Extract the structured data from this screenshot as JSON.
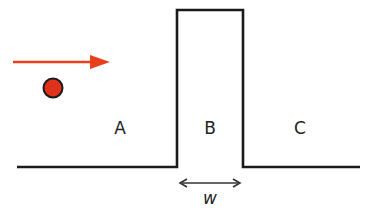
{
  "diagram": {
    "colors": {
      "line": "#1a1a1a",
      "arrow": "#e8401c",
      "ball_fill": "#e0321a",
      "ball_stroke": "#1a1a1a",
      "text": "#222222",
      "width_arrow": "#333333"
    },
    "regions": [
      {
        "id": "A",
        "label": "A"
      },
      {
        "id": "B",
        "label": "B"
      },
      {
        "id": "C",
        "label": "C"
      }
    ],
    "width_label": "w",
    "elements": {
      "incident_arrow": "right-arrow",
      "particle": "ball",
      "barrier": "rectangular-barrier",
      "width_indicator": "double-headed-arrow"
    }
  }
}
